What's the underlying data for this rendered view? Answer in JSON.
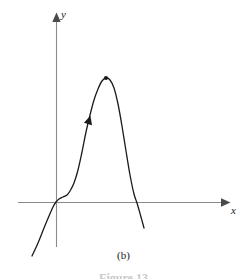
{
  "figure": {
    "caption": "(b)",
    "figure_number": "Figure 13",
    "background_color": "#ffffff"
  },
  "chart_data": {
    "type": "line",
    "title": "",
    "subtitle": "",
    "xlabel": "x",
    "ylabel": "y",
    "grid": false,
    "legend": false,
    "axes": {
      "x_axis_label": "x",
      "y_axis_label": "y",
      "x_axis_color": "#808080",
      "y_axis_color": "#808080",
      "x_axis_has_arrow": true,
      "y_axis_has_arrow": true,
      "ticks": [],
      "tick_labels": [],
      "origin": [
        56,
        202
      ]
    },
    "curve": {
      "color": "#1a1a1a",
      "line_width": 1.3,
      "description": "cubic-like curve rising from lower left through the origin, flattening near the origin, then rising steeply to a local maximum and falling steeply across the x-axis",
      "points": [
        [
          32,
          256
        ],
        [
          38,
          243
        ],
        [
          44,
          228
        ],
        [
          49,
          216
        ],
        [
          53,
          207
        ],
        [
          56,
          202
        ],
        [
          59,
          199
        ],
        [
          63,
          197
        ],
        [
          67,
          195
        ],
        [
          70,
          191
        ],
        [
          74,
          183
        ],
        [
          78,
          170
        ],
        [
          82,
          152
        ],
        [
          86,
          132
        ],
        [
          90,
          115
        ],
        [
          94,
          100
        ],
        [
          98,
          89
        ],
        [
          102,
          81
        ],
        [
          106,
          78
        ],
        [
          110,
          80
        ],
        [
          114,
          88
        ],
        [
          118,
          104
        ],
        [
          122,
          126
        ],
        [
          126,
          151
        ],
        [
          130,
          175
        ],
        [
          134,
          194
        ],
        [
          137,
          203
        ],
        [
          141,
          217
        ],
        [
          144,
          228
        ]
      ],
      "x_intercepts": [
        56,
        137
      ],
      "local_maximum": [
        106,
        78
      ]
    },
    "markers": [
      {
        "name": "local-maximum-dot",
        "type": "dot",
        "position": [
          106,
          78
        ],
        "color": "#1a1a1a",
        "radius": 2.1
      },
      {
        "name": "direction-arrowhead",
        "type": "arrowhead",
        "position": [
          88,
          124
        ],
        "color": "#1a1a1a",
        "rotation_deg": -74
      }
    ]
  }
}
